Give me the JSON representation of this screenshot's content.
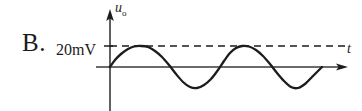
{
  "option": {
    "letter": "B."
  },
  "labels": {
    "amplitude": "20mV",
    "y_axis_main": "u",
    "y_axis_sub": "o",
    "x_axis": "t"
  },
  "colors": {
    "stroke": "#1c1c1c",
    "axis": "#3a3a3a",
    "background": "#ffffff"
  },
  "chart_data": {
    "type": "line",
    "title": "",
    "xlabel": "t",
    "ylabel": "u_o",
    "waveform": "sine",
    "amplitude_label": "20mV",
    "amplitude_px": 21,
    "cycles": 2.3,
    "period_px": 90,
    "phase": "starts at origin rising",
    "origin_px": [
      110,
      67
    ],
    "wave_start_x_px": 110,
    "wave_end_x_px": 322,
    "dashed_reference_line": {
      "present": true,
      "y_px": 46,
      "x_start_px": 110,
      "x_end_px": 345,
      "meaning": "peak amplitude 20mV"
    },
    "x_axis_arrow_end_px": 348,
    "y_axis_arrow_top_px": 10,
    "y_axis_bottom_px": 111,
    "grid": false,
    "legend": "none",
    "series": [
      {
        "name": "u_o(t)",
        "points_px": [
          [
            110,
            67
          ],
          [
            115,
            60
          ],
          [
            121,
            54
          ],
          [
            128,
            49
          ],
          [
            134,
            46.5
          ],
          [
            141,
            46
          ],
          [
            148,
            47
          ],
          [
            155,
            51
          ],
          [
            162,
            57
          ],
          [
            169,
            65
          ],
          [
            176,
            74
          ],
          [
            183,
            82
          ],
          [
            190,
            87
          ],
          [
            197,
            88
          ],
          [
            204,
            85
          ],
          [
            211,
            79
          ],
          [
            218,
            70
          ],
          [
            224,
            61
          ],
          [
            230,
            53
          ],
          [
            236,
            48
          ],
          [
            242,
            46
          ],
          [
            249,
            46.5
          ],
          [
            256,
            50
          ],
          [
            263,
            56
          ],
          [
            270,
            64
          ],
          [
            277,
            73
          ],
          [
            284,
            81
          ],
          [
            291,
            87
          ],
          [
            298,
            88
          ],
          [
            305,
            84
          ],
          [
            312,
            77
          ],
          [
            318,
            71
          ],
          [
            322,
            67
          ]
        ]
      }
    ]
  }
}
